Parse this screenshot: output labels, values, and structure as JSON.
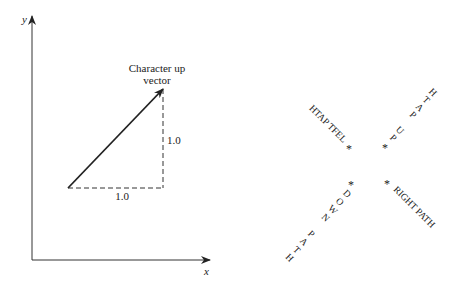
{
  "left_figure": {
    "y_axis_label": "y",
    "x_axis_label": "x",
    "vector_label_line1": "Character up",
    "vector_label_line2": "vector",
    "dx_label": "1.0",
    "dy_label": "1.0"
  },
  "right_figure": {
    "marker": "*",
    "left_path": "HTAP TFEL",
    "up_path": [
      "P",
      "U",
      " ",
      "P",
      "A",
      "T",
      "H"
    ],
    "down_path": [
      "D",
      "O",
      "W",
      "N",
      " ",
      "P",
      "A",
      "T",
      "H"
    ],
    "right_path": "RIGHT PATH"
  }
}
